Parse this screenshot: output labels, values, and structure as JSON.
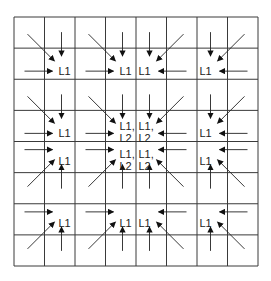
{
  "diagram": {
    "grid": {
      "rows": 8,
      "cols": 8,
      "x0": 14,
      "y0": 17,
      "x1": 258,
      "y1": 266,
      "line_color": "#3a3a3a"
    },
    "block_size": 2,
    "arrow_color": "#222222",
    "blocks": [
      {
        "row": 0,
        "col": 0,
        "quadrant": "top-left",
        "label": [
          "L1"
        ]
      },
      {
        "row": 0,
        "col": 1,
        "quadrant": "top-left",
        "label": [
          "L1"
        ]
      },
      {
        "row": 0,
        "col": 2,
        "quadrant": "top-right",
        "label": [
          "L1"
        ]
      },
      {
        "row": 0,
        "col": 3,
        "quadrant": "top-right",
        "label": [
          "L1"
        ]
      },
      {
        "row": 1,
        "col": 0,
        "quadrant": "top-left",
        "label": [
          "L1"
        ]
      },
      {
        "row": 1,
        "col": 1,
        "quadrant": "top-left",
        "label": [
          "L1,",
          "L2"
        ]
      },
      {
        "row": 1,
        "col": 2,
        "quadrant": "top-right",
        "label": [
          "L1,",
          "L2"
        ]
      },
      {
        "row": 1,
        "col": 3,
        "quadrant": "top-right",
        "label": [
          "L1"
        ]
      },
      {
        "row": 2,
        "col": 0,
        "quadrant": "bottom-left",
        "label": [
          "L1"
        ]
      },
      {
        "row": 2,
        "col": 1,
        "quadrant": "bottom-left",
        "label": [
          "L1,",
          "L2"
        ]
      },
      {
        "row": 2,
        "col": 2,
        "quadrant": "bottom-right",
        "label": [
          "L1,",
          "L2"
        ]
      },
      {
        "row": 2,
        "col": 3,
        "quadrant": "bottom-right",
        "label": [
          "L1"
        ]
      },
      {
        "row": 3,
        "col": 0,
        "quadrant": "bottom-left",
        "label": [
          "L1"
        ]
      },
      {
        "row": 3,
        "col": 1,
        "quadrant": "bottom-left",
        "label": [
          "L1"
        ]
      },
      {
        "row": 3,
        "col": 2,
        "quadrant": "bottom-right",
        "label": [
          "L1"
        ]
      },
      {
        "row": 3,
        "col": 3,
        "quadrant": "bottom-right",
        "label": [
          "L1"
        ]
      }
    ]
  }
}
